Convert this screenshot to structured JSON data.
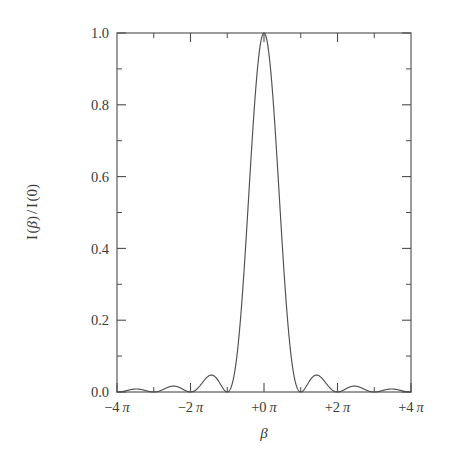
{
  "figure": {
    "background_color": "#ffffff",
    "line_color": "#4f4f4f",
    "axis_color": "#4a4a4a",
    "text_color": "#3b3b3b"
  },
  "axes": {
    "y_title": "I(β) / I(0)",
    "y_title_parts": {
      "i1": "I",
      "open1": "(",
      "beta": "β",
      "close1": ")",
      "slash": "/",
      "i2": "I",
      "open2": "(",
      "zero": "0",
      "close2": ")"
    },
    "x_title": "β",
    "y_ticks": [
      "0.0",
      "0.2",
      "0.4",
      "0.6",
      "0.8",
      "1.0"
    ],
    "y_tick_values": [
      0.0,
      0.2,
      0.4,
      0.6,
      0.8,
      1.0
    ],
    "x_ticks": [
      "−4 π",
      "−2 π",
      "+0 π",
      "+2 π",
      "+4 π"
    ],
    "x_tick_values": [
      -4,
      -2,
      0,
      2,
      4
    ],
    "x_tick_signs": [
      "−4",
      "−2",
      "+0",
      "+2",
      "+4"
    ],
    "x_tick_unit": "π",
    "x_minor_count": 1,
    "y_minor_count": 1
  },
  "chart_data": {
    "type": "line",
    "title": "",
    "subtitle": "",
    "xlabel": "β",
    "ylabel": "I(β)/I(0)",
    "xlim": [
      -12.566370614,
      12.566370614
    ],
    "ylim": [
      0.0,
      1.0
    ],
    "xlim_in_pi": [
      -4,
      4
    ],
    "grid": false,
    "legend": null,
    "function": "(sin(beta)/beta)^2",
    "annotations": [],
    "series": [
      {
        "name": "I(β)/I(0)",
        "color": "#4f4f4f",
        "x_in_pi": [
          -4.0,
          -3.9,
          -3.8,
          -3.7,
          -3.6,
          -3.5,
          -3.4,
          -3.3,
          -3.2,
          -3.1,
          -3.0,
          -2.9,
          -2.8,
          -2.7,
          -2.6,
          -2.5,
          -2.4,
          -2.3,
          -2.2,
          -2.1,
          -2.0,
          -1.9,
          -1.8,
          -1.7,
          -1.6,
          -1.5,
          -1.4,
          -1.3,
          -1.2,
          -1.1,
          -1.0,
          -0.9,
          -0.8,
          -0.7,
          -0.6,
          -0.5,
          -0.4,
          -0.3,
          -0.2,
          -0.1,
          0.0,
          0.1,
          0.2,
          0.3,
          0.4,
          0.5,
          0.6,
          0.7,
          0.8,
          0.9,
          1.0,
          1.1,
          1.2,
          1.3,
          1.4,
          1.5,
          1.6,
          1.7,
          1.8,
          1.9,
          2.0,
          2.1,
          2.2,
          2.3,
          2.4,
          2.5,
          2.6,
          2.7,
          2.8,
          2.9,
          3.0,
          3.1,
          3.2,
          3.3,
          3.4,
          3.5,
          3.6,
          3.7,
          3.8,
          3.9,
          4.0
        ],
        "y": [
          0.0,
          0.00064,
          0.00234,
          0.00448,
          0.00623,
          0.0069,
          0.00623,
          0.00448,
          0.00234,
          0.00064,
          0.0,
          0.00085,
          0.00315,
          0.00611,
          0.00865,
          0.00974,
          0.00891,
          0.00652,
          0.00346,
          0.00095,
          0.0,
          0.00131,
          0.00493,
          0.00973,
          0.01404,
          0.01621,
          0.01516,
          0.01136,
          0.00616,
          0.00173,
          0.0,
          0.00252,
          0.0098,
          0.02019,
          0.03073,
          0.03725,
          0.03683,
          0.02925,
          0.01684,
          0.00494,
          1.0,
          0.00494,
          0.01684,
          0.02925,
          0.03683,
          0.03725,
          0.03073,
          0.02019,
          0.0098,
          0.00252,
          0.0,
          0.00173,
          0.00616,
          0.01136,
          0.01516,
          0.01621,
          0.01404,
          0.00973,
          0.00493,
          0.00131,
          0.0,
          0.00095,
          0.00346,
          0.00652,
          0.00891,
          0.00974,
          0.00865,
          0.00611,
          0.00315,
          0.00085,
          0.0,
          0.00064,
          0.00234,
          0.00448,
          0.00623,
          0.0069,
          0.00623,
          0.00448,
          0.00234,
          0.00064,
          0.0
        ]
      }
    ],
    "key_points": {
      "central_maximum": {
        "x_in_pi": 0,
        "y": 1.0
      },
      "zeros_in_pi": [
        -4,
        -3,
        -2,
        -1,
        1,
        2,
        3,
        4
      ],
      "side_lobe_maxima": [
        {
          "x_in_pi": -3.47,
          "y": 0.0083
        },
        {
          "x_in_pi": -2.46,
          "y": 0.0165
        },
        {
          "x_in_pi": -1.43,
          "y": 0.0472
        },
        {
          "x_in_pi": 1.43,
          "y": 0.0472
        },
        {
          "x_in_pi": 2.46,
          "y": 0.0165
        },
        {
          "x_in_pi": 3.47,
          "y": 0.0083
        }
      ]
    }
  }
}
